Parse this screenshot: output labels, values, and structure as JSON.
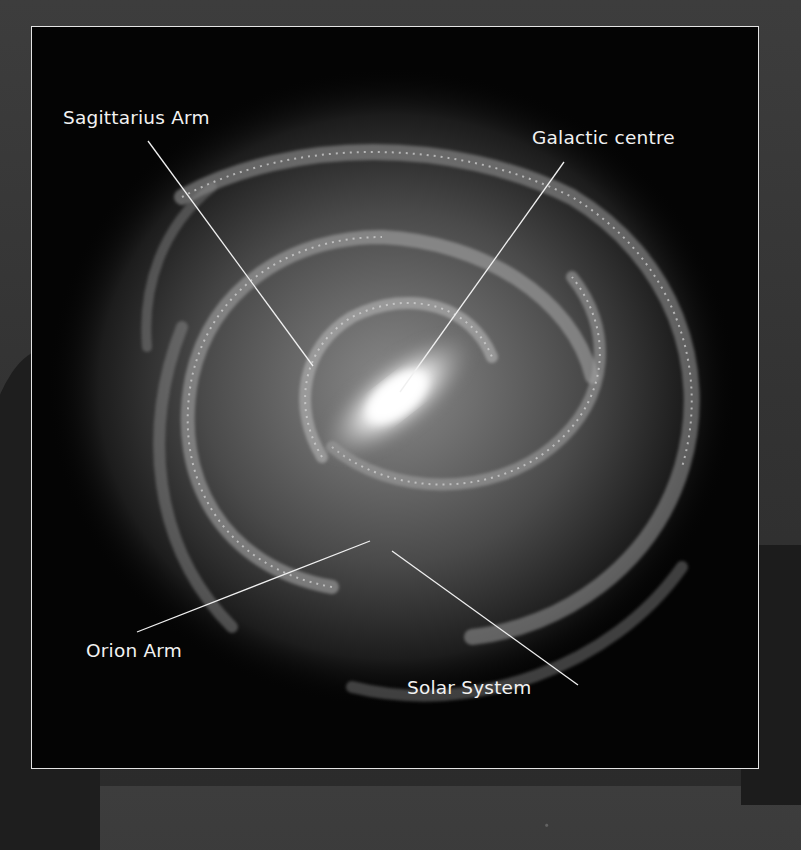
{
  "image": {
    "subject": "Milky Way galaxy top-down illustration",
    "style": "grayscale",
    "frame_color": "#e4e4e4"
  },
  "labels": [
    {
      "id": "sagittarius-arm",
      "text": "Sagittarius Arm"
    },
    {
      "id": "galactic-centre",
      "text": "Galactic centre"
    },
    {
      "id": "orion-arm",
      "text": "Orion Arm"
    },
    {
      "id": "solar-system",
      "text": "Solar System"
    }
  ]
}
